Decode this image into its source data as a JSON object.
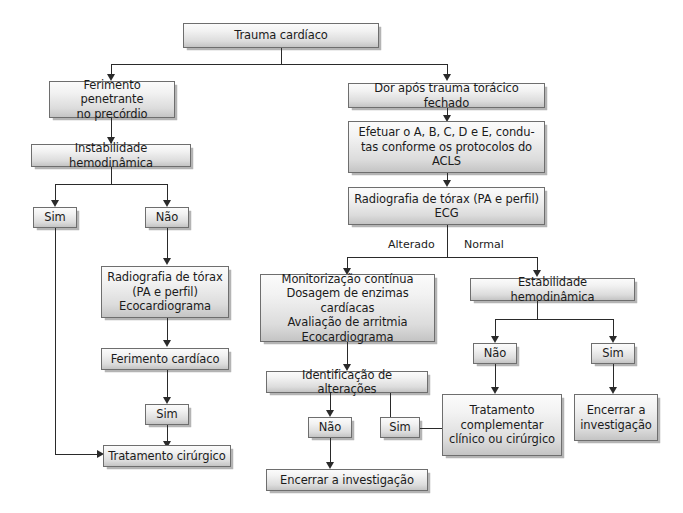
{
  "diagram": {
    "language": "pt-BR",
    "type": "flowchart",
    "accent_color": "#dcdcdc",
    "border_color": "#6e6e6e",
    "line_color": "#2a2a2a"
  },
  "nodes": {
    "root": "Trauma cardíaco",
    "left": {
      "penetrating": "Ferimento penetrante\nno precórdio",
      "instability": "Instabilidade hemodinâmica",
      "yes": "Sim",
      "no": "Não",
      "xray_echo": "Radiografia de tórax\n(PA e perfil)\nEcocardiograma",
      "cardiac_wound": "Ferimento cardíaco",
      "yes2": "Sim",
      "surgical": "Tratamento cirúrgico"
    },
    "right": {
      "blunt_pain": "Dor após trauma torácico fechado",
      "acls": "Efetuar o A, B, C, D e E, condu-\ntas conforme os protocolos do\nACLS",
      "xray_ecg": "Radiografia de tórax (PA e perfil)\nECG",
      "label_altered": "Alterado",
      "label_normal": "Normal",
      "monitoring": "Monitorização contínua\nDosagem de enzimas cardíacas\nAvaliação de arritmia\nEcocardiograma",
      "identify_changes": "Identificação de alterações",
      "no_changes": "Não",
      "yes_changes": "Sim",
      "end_investigation_left": "Encerrar a investigação",
      "stability": "Estabilidade hemodinâmica",
      "stability_no": "Não",
      "stability_yes": "Sim",
      "complementary": "Tratamento\ncomplementar\nclínico ou cirúrgico",
      "end_investigation_right": "Encerrar a\ninvestigação"
    }
  }
}
